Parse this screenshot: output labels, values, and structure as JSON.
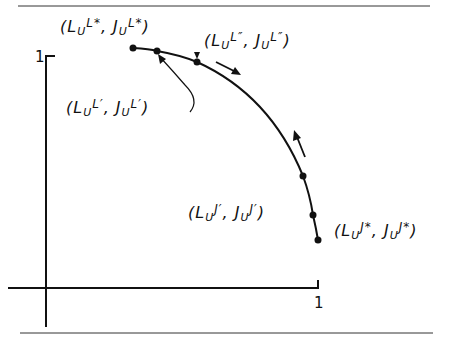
{
  "figure": {
    "type": "utility-possibility-frontier diagram",
    "axis_ticks": {
      "x_max": "1",
      "y_max": "1"
    },
    "stroke_color": "#111111",
    "background": "#ffffff"
  },
  "labels": {
    "l_star": {
      "open": "(",
      "a": "L",
      "a_sub": "U",
      "a_sup": "L*",
      "sep": ", ",
      "b": "J",
      "b_sub": "U",
      "b_sup": "L*",
      "close": ")"
    },
    "l_dprime": {
      "open": "(",
      "a": "L",
      "a_sub": "U",
      "a_sup": "L″",
      "sep": ", ",
      "b": "J",
      "b_sub": "U",
      "b_sup": "L″",
      "close": ")"
    },
    "l_prime": {
      "open": "(",
      "a": "L",
      "a_sub": "U",
      "a_sup": "L′",
      "sep": ", ",
      "b": "J",
      "b_sub": "U",
      "b_sup": "L′",
      "close": ")"
    },
    "j_prime": {
      "open": "(",
      "a": "L",
      "a_sub": "U",
      "a_sup": "J′",
      "sep": ", ",
      "b": "J",
      "b_sub": "U",
      "b_sup": "J′",
      "close": ")"
    },
    "j_star": {
      "open": "(",
      "a": "L",
      "a_sub": "U",
      "a_sup": "J*",
      "sep": ", ",
      "b": "J",
      "b_sub": "U",
      "b_sup": "J*",
      "close": ")"
    }
  },
  "points": [
    {
      "id": "L*",
      "x": 133,
      "y": 48
    },
    {
      "id": "L'",
      "x": 157,
      "y": 51
    },
    {
      "id": "L''",
      "x": 197,
      "y": 62
    },
    {
      "id": "mid",
      "x": 303,
      "y": 176
    },
    {
      "id": "J'",
      "x": 313,
      "y": 215
    },
    {
      "id": "J*",
      "x": 318,
      "y": 240
    }
  ]
}
